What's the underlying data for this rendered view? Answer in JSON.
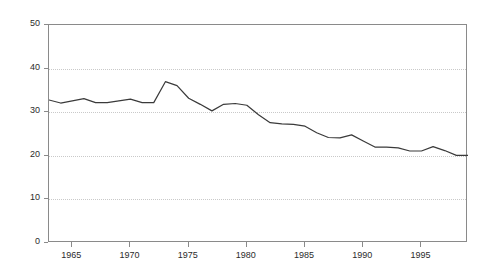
{
  "chart_data": {
    "type": "line",
    "title": "",
    "subtitle": "",
    "xlabel": "",
    "ylabel": "",
    "xlim": [
      1963,
      1999
    ],
    "ylim": [
      0,
      50
    ],
    "grid": true,
    "legend": "none",
    "y_ticks": [
      0,
      10,
      20,
      30,
      40,
      50
    ],
    "y_tick_labels": [
      "0",
      "10",
      "20",
      "30",
      "40",
      "50"
    ],
    "x_ticks": [
      1965,
      1970,
      1975,
      1980,
      1985,
      1990,
      1995
    ],
    "x_tick_labels": [
      "1965",
      "1970",
      "1975",
      "1980",
      "1985",
      "1990",
      "1995"
    ],
    "line_color": "#3a3a3a",
    "grid_color": "#c9c9c9",
    "axis_color": "#8a8a8a",
    "series": [
      {
        "name": "series-1",
        "x": [
          1963,
          1964,
          1965,
          1966,
          1967,
          1968,
          1969,
          1970,
          1971,
          1972,
          1973,
          1974,
          1975,
          1976,
          1977,
          1978,
          1979,
          1980,
          1981,
          1982,
          1983,
          1984,
          1985,
          1986,
          1987,
          1988,
          1989,
          1990,
          1991,
          1992,
          1993,
          1994,
          1995,
          1996,
          1997,
          1998,
          1999
        ],
        "values": [
          32.8,
          32.1,
          32.6,
          33.1,
          32.2,
          32.2,
          32.6,
          33.0,
          32.2,
          32.2,
          37.0,
          36.1,
          33.2,
          31.8,
          30.3,
          31.8,
          32.0,
          31.6,
          29.4,
          27.6,
          27.3,
          27.2,
          26.8,
          25.3,
          24.2,
          24.1,
          24.8,
          23.4,
          22.0,
          22.0,
          21.8,
          21.1,
          21.1,
          22.1,
          21.2,
          20.1,
          20.1
        ]
      }
    ]
  },
  "watermarks": {
    "top": "",
    "bottom": ""
  }
}
